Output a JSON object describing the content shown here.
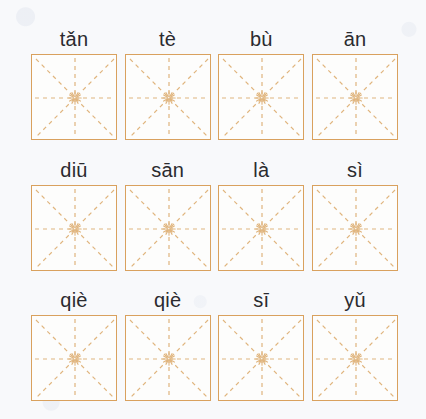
{
  "page": {
    "background_color": "#f8f9fb",
    "grid_border_color": "#d9a15e",
    "grid_guide_color": "#e0b57e",
    "label_color": "#2b2b2f",
    "grid_type": "mi-zi-ge",
    "rows": 3,
    "columns": 4,
    "total_cells": 12
  },
  "rows": [
    {
      "index": 1,
      "cells": [
        {
          "pinyin": "tǎn"
        },
        {
          "pinyin": "tè"
        },
        {
          "pinyin": "bù"
        },
        {
          "pinyin": "ān"
        }
      ]
    },
    {
      "index": 2,
      "cells": [
        {
          "pinyin": "diū"
        },
        {
          "pinyin": "sān"
        },
        {
          "pinyin": "là"
        },
        {
          "pinyin": "sì"
        }
      ]
    },
    {
      "index": 3,
      "cells": [
        {
          "pinyin": "qiè"
        },
        {
          "pinyin": "qiè"
        },
        {
          "pinyin": "sī"
        },
        {
          "pinyin": "yǔ"
        }
      ]
    }
  ]
}
